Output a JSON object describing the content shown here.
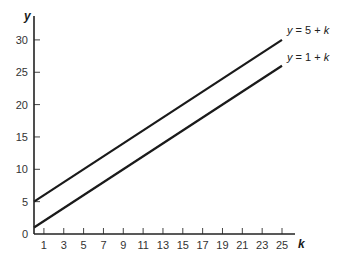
{
  "chart_data": {
    "type": "line",
    "title": "",
    "xlabel": "k",
    "ylabel": "y",
    "xlim": [
      0,
      26
    ],
    "ylim": [
      0,
      32
    ],
    "x_ticks": [
      1,
      3,
      5,
      7,
      9,
      11,
      13,
      15,
      17,
      19,
      21,
      23,
      25
    ],
    "y_ticks": [
      0,
      5,
      10,
      15,
      20,
      25,
      30
    ],
    "grid": false,
    "legend": "inline labels at line ends",
    "series": [
      {
        "name": "y = 5 + k",
        "x": [
          0,
          25
        ],
        "values": [
          5,
          30
        ],
        "color": "#1a1a1a"
      },
      {
        "name": "y = 1 + k",
        "x": [
          0,
          25
        ],
        "values": [
          1,
          26
        ],
        "color": "#1a1a1a"
      }
    ]
  },
  "labels": {
    "x_axis": "k",
    "y_axis": "y",
    "line_top": {
      "var": "y",
      "rest": " = 5 + ",
      "param": "k"
    },
    "line_bottom": {
      "var": "y",
      "rest": " = 1 + ",
      "param": "k"
    }
  }
}
